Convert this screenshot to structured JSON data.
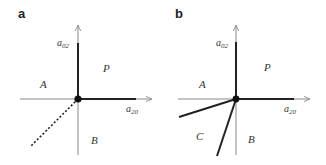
{
  "panels": [
    {
      "label": "a",
      "x_axis": {
        "name": "a",
        "sub": "20"
      },
      "y_axis": {
        "name": "a",
        "sub": "02"
      },
      "regions": {
        "top_right": "P",
        "left": "A",
        "bottom": "B"
      },
      "boundaries": [
        "solid positive a02 axis",
        "solid positive a20 axis",
        "dotted line into third quadrant"
      ]
    },
    {
      "label": "b",
      "x_axis": {
        "name": "a",
        "sub": "20"
      },
      "y_axis": {
        "name": "a",
        "sub": "02"
      },
      "regions": {
        "top_right": "P",
        "left": "A",
        "bottom_left": "C",
        "bottom": "B"
      },
      "boundaries": [
        "solid positive a02 axis",
        "solid positive a20 axis",
        "solid line A|C",
        "solid line C|B"
      ]
    }
  ],
  "colors": {
    "axis": "#888888",
    "boundary": "#222222",
    "origin": "#111111"
  }
}
